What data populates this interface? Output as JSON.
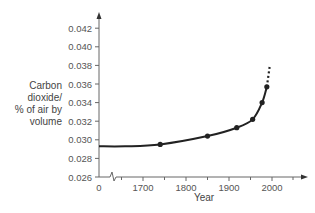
{
  "chart_data": {
    "type": "line",
    "title": "",
    "xlabel": "Year",
    "ylabel": "Carbon dioxide/ % of air by volume",
    "ylabel_lines": [
      "Carbon",
      "dioxide/",
      "% of air by",
      "volume"
    ],
    "x_ticks": [
      "0",
      "1700",
      "1800",
      "1900",
      "2000"
    ],
    "y_ticks": [
      "0.026",
      "0.028",
      "0.030",
      "0.032",
      "0.034",
      "0.036",
      "0.038",
      "0.040",
      "0.042"
    ],
    "ylim": [
      0.026,
      0.042
    ],
    "xlim": [
      1650,
      2080
    ],
    "x_axis_break": true,
    "grid": false,
    "series": [
      {
        "name": "Carbon dioxide",
        "x": [
          1740,
          1850,
          1918,
          1955,
          1977,
          1988
        ],
        "y": [
          0.0295,
          0.0304,
          0.0313,
          0.0322,
          0.034,
          0.0357
        ],
        "baseline_start": {
          "x": 0,
          "y": 0.0293
        },
        "projection_dotted": {
          "x": [
            1988,
            1995
          ],
          "y": [
            0.0357,
            0.038
          ]
        }
      }
    ]
  },
  "colors": {
    "line": "#222222",
    "axis": "#666666",
    "text": "#555555"
  }
}
